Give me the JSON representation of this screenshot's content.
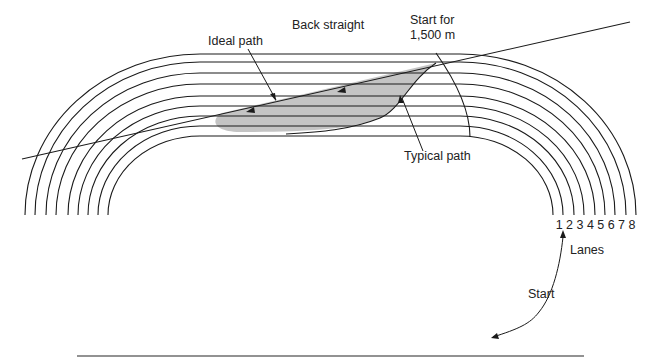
{
  "diagram": {
    "labels": {
      "back_straight": "Back straight",
      "ideal_path": "Ideal path",
      "start_for_line1": "Start for",
      "start_for_line2": "1,500 m",
      "typical_path": "Typical path",
      "lanes": "Lanes",
      "start": "Start"
    },
    "lane_numbers": [
      "1",
      "2",
      "3",
      "4",
      "5",
      "6",
      "7",
      "8"
    ],
    "colors": {
      "line": "#1a1a1a",
      "shaded_region": "#c4c4c4",
      "baseline": "#6e6e6e"
    }
  }
}
